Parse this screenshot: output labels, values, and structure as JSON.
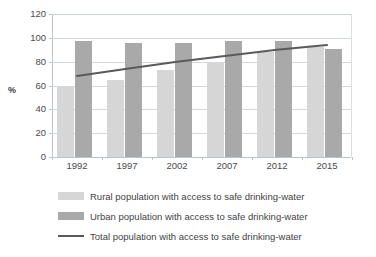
{
  "chart_data": {
    "type": "bar",
    "title": "",
    "subtitle": "",
    "xlabel": "",
    "ylabel": "%",
    "ylim": [
      0,
      120
    ],
    "ytick_step": 20,
    "yticks": [
      0,
      20,
      40,
      60,
      80,
      100,
      120
    ],
    "categories": [
      "1992",
      "1997",
      "2002",
      "2007",
      "2012",
      "2015"
    ],
    "grid": true,
    "legend_position": "bottom",
    "series": [
      {
        "name": "Rural population with access to safe drinking-water",
        "kind": "bar",
        "color": "#d6d6d6",
        "values": [
          59,
          65,
          73,
          79,
          88,
          92
        ]
      },
      {
        "name": "Urban population with access to safe drinking-water",
        "kind": "bar",
        "color": "#a9a9a9",
        "values": [
          97,
          96,
          96,
          97,
          97,
          91
        ]
      },
      {
        "name": "Total population with access to safe drinking-water",
        "kind": "line",
        "color": "#5a5a5a",
        "values": [
          68,
          74,
          80,
          85,
          90,
          94
        ]
      }
    ]
  },
  "axis": {
    "y_label": "%",
    "y_ticks": [
      "0",
      "20",
      "40",
      "60",
      "80",
      "100",
      "120"
    ],
    "x_ticks": [
      "1992",
      "1997",
      "2002",
      "2007",
      "2012",
      "2015"
    ]
  },
  "legend": {
    "items": [
      {
        "label": "Rural population with  access to safe drinking-water",
        "swatch": "rural-swatch"
      },
      {
        "label": "Urban population with  access to safe drinking-water",
        "swatch": "urban-swatch"
      },
      {
        "label": "Total population  with access to safe drinking-water",
        "swatch": "line-swatch"
      }
    ]
  },
  "colors": {
    "rural": "#d6d6d6",
    "urban": "#a9a9a9",
    "line": "#5a5a5a",
    "grid": "#d2d9e0",
    "axis": "#b9c4cf",
    "text": "#404040"
  }
}
